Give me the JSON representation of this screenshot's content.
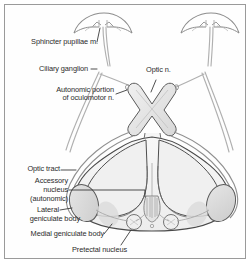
{
  "figure": {
    "type": "anatomical-diagram",
    "background_color": "#ffffff",
    "frame_color": "#9a9a9a",
    "ink_color": "#3a3a3a",
    "nerve_color": "#a9a9a9",
    "fill_light": "#f2f2f2",
    "fill_mid": "#e0e0e0",
    "fill_dark": "#cfcfcf"
  },
  "labels": {
    "sphincter_pupillae": "Sphincter pupillae m.",
    "ciliary_ganglion": "Ciliary ganglion",
    "autonomic_portion_line1": "Autonomic portion",
    "autonomic_portion_line2": "of oculomotor n.",
    "optic_n": "Optic n.",
    "optic_tract": "Optic tract",
    "accessory_nucleus_line1": "Accessory",
    "accessory_nucleus_line2": "nucleus",
    "accessory_nucleus_line3": "(autonomic)",
    "lateral_geniculate_line1": "Lateral",
    "lateral_geniculate_line2": "geniculate body",
    "medial_geniculate": "Medial geniculate body",
    "pretectal_nucleus": "Pretectal nucleus"
  },
  "structures": [
    {
      "name": "left-eye",
      "label": "Sphincter pupillae m."
    },
    {
      "name": "right-eye",
      "label": "Sphincter pupillae m."
    },
    {
      "name": "left-ciliary-ganglion",
      "label": "Ciliary ganglion"
    },
    {
      "name": "right-ciliary-ganglion",
      "label": "Ciliary ganglion"
    },
    {
      "name": "optic-chiasm",
      "label": "Optic n."
    },
    {
      "name": "midbrain-cross-section",
      "label": "Midbrain"
    },
    {
      "name": "left-optic-tract",
      "label": "Optic tract"
    },
    {
      "name": "right-optic-tract",
      "label": "Optic tract"
    },
    {
      "name": "left-lateral-geniculate-body",
      "label": "Lateral geniculate body"
    },
    {
      "name": "right-lateral-geniculate-body",
      "label": "Lateral geniculate body"
    },
    {
      "name": "left-medial-geniculate-body",
      "label": "Medial geniculate body"
    },
    {
      "name": "right-medial-geniculate-body",
      "label": "Medial geniculate body"
    },
    {
      "name": "left-pretectal-nucleus",
      "label": "Pretectal nucleus"
    },
    {
      "name": "right-pretectal-nucleus",
      "label": "Pretectal nucleus"
    },
    {
      "name": "accessory-nucleus",
      "label": "Accessory nucleus (autonomic)"
    }
  ]
}
